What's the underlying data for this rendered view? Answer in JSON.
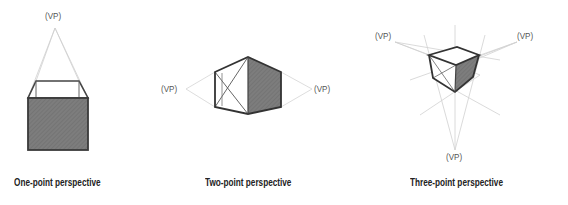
{
  "diagrams": [
    {
      "caption": "One-point perspective",
      "vp_labels": [
        "(VP)"
      ]
    },
    {
      "caption": "Two-point perspective",
      "vp_labels": [
        "(VP)",
        "(VP)"
      ]
    },
    {
      "caption": "Three-point perspective",
      "vp_labels": [
        "(VP)",
        "(VP)",
        "(VP)"
      ]
    }
  ],
  "colors": {
    "edge": "#333333",
    "shade": "#7a7a7a",
    "guide": "#c8c8c8"
  }
}
